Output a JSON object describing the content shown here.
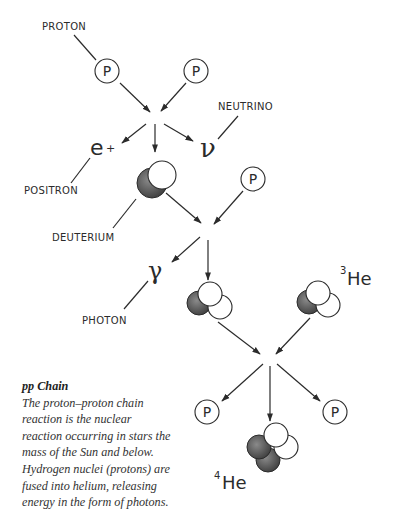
{
  "diagram": {
    "title": "pp Chain",
    "labels": {
      "proton": "PROTON",
      "neutrino": "NEUTRINO",
      "positron": "POSITRON",
      "deuterium": "DEUTERIUM",
      "photon": "PHOTON"
    },
    "symbols": {
      "proton": "P",
      "positron": "e",
      "positron_sup": "+",
      "neutrino": "ν",
      "photon": "γ",
      "helium3_mass": "3",
      "helium3": "He",
      "helium4_mass": "4",
      "helium4": "He"
    },
    "stages": [
      {
        "inputs": [
          "proton",
          "proton"
        ],
        "outputs": [
          "positron",
          "deuterium",
          "neutrino"
        ]
      },
      {
        "inputs": [
          "deuterium",
          "proton"
        ],
        "outputs": [
          "photon",
          "helium-3"
        ]
      },
      {
        "inputs": [
          "helium-3",
          "helium-3"
        ],
        "outputs": [
          "proton",
          "helium-4",
          "proton"
        ]
      }
    ],
    "colors": {
      "ink": "#2b2b2b",
      "neutron_shade": "#555555",
      "background": "#ffffff"
    }
  },
  "caption": {
    "title": "pp Chain",
    "body": "The proton–proton chain reaction is the nuclear reaction occurring in stars the mass of the Sun and below. Hydrogen nuclei (protons) are fused into helium, releasing energy in the form of photons."
  }
}
